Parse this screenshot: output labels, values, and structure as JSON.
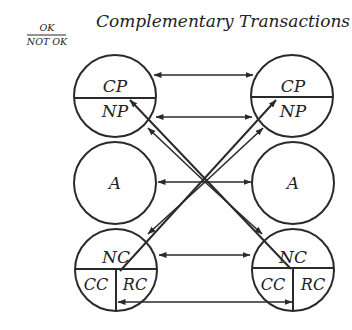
{
  "header": {
    "title": "Complementary Transactions",
    "legend_top": "OK",
    "legend_bottom": "NOT OK"
  },
  "left_person": {
    "parent": {
      "top": "CP",
      "bottom": "NP"
    },
    "adult": "A",
    "child": {
      "top": "NC",
      "bottom_left": "CC",
      "bottom_right": "RC"
    }
  },
  "right_person": {
    "parent": {
      "top": "CP",
      "bottom": "NP"
    },
    "adult": "A",
    "child": {
      "top": "NC",
      "bottom_left": "CC",
      "bottom_right": "RC"
    }
  },
  "transactions": [
    {
      "from": "left.CP",
      "to": "right.CP",
      "type": "bidirectional"
    },
    {
      "from": "left.NP",
      "to": "right.NP",
      "type": "bidirectional"
    },
    {
      "from": "left.A",
      "to": "right.A",
      "type": "bidirectional"
    },
    {
      "from": "left.NC",
      "to": "right.NC",
      "type": "bidirectional"
    },
    {
      "from": "left.RC",
      "to": "right.CC",
      "type": "bidirectional"
    },
    {
      "from": "right.RC",
      "to": "left.NP",
      "type": "crossing"
    },
    {
      "from": "left.CC",
      "to": "right.NP",
      "type": "crossing"
    },
    {
      "from": "left.NP-edge",
      "to": "right.NC-edge",
      "type": "crossing"
    },
    {
      "from": "right.NP-edge",
      "to": "left.NC-edge",
      "type": "crossing"
    }
  ]
}
